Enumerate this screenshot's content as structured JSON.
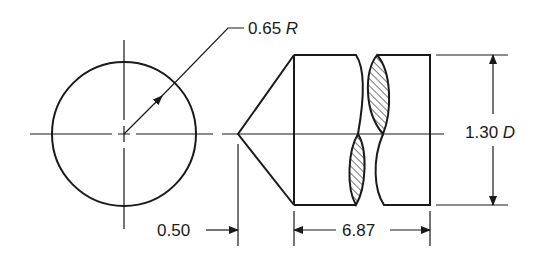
{
  "drawing": {
    "title": "Cylindrical part with conical point - end and side views",
    "radius_label": {
      "value": "0.65",
      "unit": "R"
    },
    "diameter_label": {
      "value": "1.30",
      "unit": "D"
    },
    "point_length_label": "0.50",
    "body_length_label": "6.87",
    "colors": {
      "line": "#1a1a1a",
      "background": "#ffffff"
    }
  }
}
